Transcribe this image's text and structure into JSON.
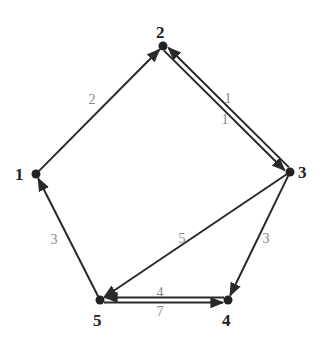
{
  "graph": {
    "type": "directed-weighted",
    "nodes": [
      {
        "id": "1",
        "label": "1",
        "x": 36,
        "y": 174,
        "lx": 15,
        "ly": 180
      },
      {
        "id": "2",
        "label": "2",
        "x": 163,
        "y": 46,
        "lx": 156,
        "ly": 38
      },
      {
        "id": "3",
        "label": "3",
        "x": 290,
        "y": 172,
        "lx": 298,
        "ly": 178
      },
      {
        "id": "4",
        "label": "4",
        "x": 228,
        "y": 300,
        "lx": 222,
        "ly": 326
      },
      {
        "id": "5",
        "label": "5",
        "x": 100,
        "y": 300,
        "lx": 93,
        "ly": 326
      }
    ],
    "edges": [
      {
        "from": "1",
        "to": "2",
        "weight": "2",
        "lx": 92,
        "ly": 104
      },
      {
        "from": "2",
        "to": "3",
        "weight": "1",
        "lx": 228,
        "ly": 103
      },
      {
        "from": "3",
        "to": "2",
        "weight": "1",
        "lx": 225,
        "ly": 124
      },
      {
        "from": "3",
        "to": "5",
        "weight": "5",
        "lx": 182,
        "ly": 243
      },
      {
        "from": "3",
        "to": "4",
        "weight": "3",
        "lx": 266,
        "ly": 243
      },
      {
        "from": "4",
        "to": "5",
        "weight": "4",
        "lx": 160,
        "ly": 297
      },
      {
        "from": "5",
        "to": "4",
        "weight": "7",
        "lx": 160,
        "ly": 316
      },
      {
        "from": "5",
        "to": "1",
        "weight": "3",
        "lx": 54,
        "ly": 244
      }
    ]
  }
}
